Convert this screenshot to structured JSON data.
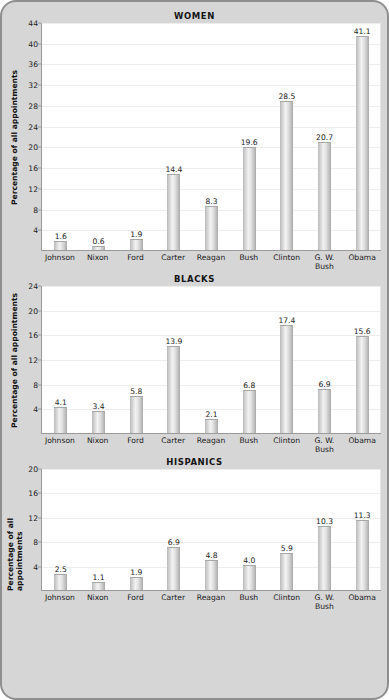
{
  "figure": {
    "background_color": "#d6d6d6",
    "border_color": "#8f8f8f",
    "plot_background": "#ffffff",
    "bar_color": "#d9d9d9",
    "gridline_color": "#ededed",
    "axis_color": "#9a9a9a",
    "text_color": "#1a1a1a"
  },
  "chart_data": [
    {
      "type": "bar",
      "title": "WOMEN",
      "xlabel": "",
      "ylabel": "Percentage of all appointments",
      "categories": [
        "Johnson",
        "Nixon",
        "Ford",
        "Carter",
        "Reagan",
        "Bush",
        "Clinton",
        "G. W.\nBush",
        "Obama"
      ],
      "values": [
        1.6,
        0.6,
        1.9,
        14.4,
        8.3,
        19.6,
        28.5,
        20.7,
        41.1
      ],
      "value_labels": [
        "1.6",
        "0.6",
        "1.9",
        "14.4",
        "8.3",
        "19.6",
        "28.5",
        "20.7",
        "41.1"
      ],
      "ylim": [
        0,
        44
      ],
      "yticks": [
        4,
        8,
        12,
        16,
        20,
        24,
        28,
        32,
        36,
        40,
        44
      ],
      "ytick_labels": [
        "4",
        "8",
        "12",
        "16",
        "20",
        "24",
        "28",
        "32",
        "36",
        "40",
        "44"
      ],
      "grid": true,
      "legend": "none"
    },
    {
      "type": "bar",
      "title": "BLACKS",
      "xlabel": "",
      "ylabel": "Percentage of all appointments",
      "categories": [
        "Johnson",
        "Nixon",
        "Ford",
        "Carter",
        "Reagan",
        "Bush",
        "Clinton",
        "G. W.\nBush",
        "Obama"
      ],
      "values": [
        4.1,
        3.4,
        5.8,
        13.9,
        2.1,
        6.8,
        17.4,
        6.9,
        15.6
      ],
      "value_labels": [
        "4.1",
        "3.4",
        "5.8",
        "13.9",
        "2.1",
        "6.8",
        "17.4",
        "6.9",
        "15.6"
      ],
      "ylim": [
        0,
        24
      ],
      "yticks": [
        4,
        8,
        12,
        16,
        20,
        24
      ],
      "ytick_labels": [
        "4",
        "8",
        "12",
        "16",
        "20",
        "24"
      ],
      "grid": true,
      "legend": "none"
    },
    {
      "type": "bar",
      "title": "HISPANICS",
      "xlabel": "",
      "ylabel": "Percentage of all appointments",
      "categories": [
        "Johnson",
        "Nixon",
        "Ford",
        "Carter",
        "Reagan",
        "Bush",
        "Clinton",
        "G. W.\nBush",
        "Obama"
      ],
      "values": [
        2.5,
        1.1,
        1.9,
        6.9,
        4.8,
        4.0,
        5.9,
        10.3,
        11.3
      ],
      "value_labels": [
        "2.5",
        "1.1",
        "1.9",
        "6.9",
        "4.8",
        "4.0",
        "5.9",
        "10.3",
        "11.3"
      ],
      "ylim": [
        0,
        20
      ],
      "yticks": [
        4,
        8,
        12,
        16,
        20
      ],
      "ytick_labels": [
        "4",
        "8",
        "12",
        "16",
        "20"
      ],
      "grid": true,
      "legend": "none"
    }
  ],
  "layout": {
    "plot_heights": [
      228,
      148,
      122
    ]
  }
}
